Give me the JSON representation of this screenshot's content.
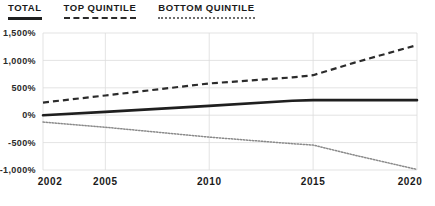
{
  "legend": {
    "position": "top-left",
    "items": [
      {
        "label": "TOTAL",
        "style": "solid",
        "color": "#1f1f1f"
      },
      {
        "label": "TOP QUINTILE",
        "style": "dashed",
        "color": "#2b2b2b"
      },
      {
        "label": "BOTTOM QUINTILE",
        "style": "dotted",
        "color": "#8a8a8a"
      }
    ]
  },
  "chart_data": {
    "type": "line",
    "title": "",
    "xlabel": "",
    "ylabel": "",
    "grid": true,
    "legend_position": "top-left",
    "xlim": [
      2002,
      2020
    ],
    "ylim": [
      -1000,
      1500
    ],
    "x_ticks": [
      2002,
      2005,
      2010,
      2015,
      2020
    ],
    "x_tick_labels": [
      "2002",
      "2005",
      "2010",
      "2015",
      "2020"
    ],
    "y_ticks": [
      1500,
      1000,
      500,
      0,
      -500,
      -1000
    ],
    "y_tick_labels": [
      "1,500%",
      "1,000%",
      "500%",
      "0%",
      "-500%",
      "-1,000%"
    ],
    "x": [
      2002,
      2005,
      2010,
      2014,
      2015,
      2017,
      2020
    ],
    "series": [
      {
        "name": "TOTAL",
        "style": "solid",
        "color": "#1f1f1f",
        "values": [
          0,
          60,
          170,
          265,
          275,
          275,
          275
        ]
      },
      {
        "name": "TOP QUINTILE",
        "style": "dashed",
        "color": "#2b2b2b",
        "values": [
          230,
          360,
          580,
          690,
          730,
          960,
          1280
        ]
      },
      {
        "name": "BOTTOM QUINTILE",
        "style": "dotted",
        "color": "#8a8a8a",
        "values": [
          -125,
          -220,
          -400,
          -520,
          -545,
          -730,
          -990
        ]
      }
    ]
  }
}
